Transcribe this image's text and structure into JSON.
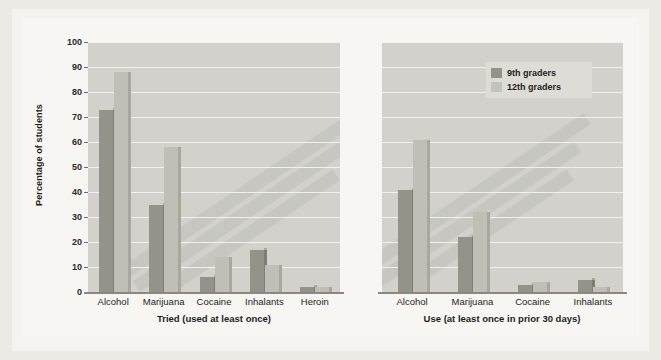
{
  "chart_data": {
    "type": "bar",
    "title": "",
    "ylabel": "Percentage of students",
    "ylim": [
      0,
      100
    ],
    "ytick_values": [
      100,
      90,
      80,
      70,
      60,
      50,
      40,
      30,
      20,
      10,
      0
    ],
    "grid": true,
    "legend_position": "top-right",
    "legend": [
      "9th graders",
      "12th graders"
    ],
    "colors": {
      "series_9th": "#949389",
      "series_12th": "#c0bfb7",
      "panel_background": "#d2d1cc",
      "page_background": "#f4f3ef"
    },
    "panels": [
      {
        "xlabel": "Tried (used at least once)",
        "categories": [
          "Alcohol",
          "Marijuana",
          "Cocaine",
          "Inhalants",
          "Heroin"
        ],
        "series": [
          {
            "name": "9th graders",
            "values": [
              73,
              35,
              6,
              17,
              2
            ]
          },
          {
            "name": "12th graders",
            "values": [
              88,
              58,
              14,
              11,
              2
            ]
          }
        ]
      },
      {
        "xlabel": "Use (at least once in prior 30 days)",
        "categories": [
          "Alcohol",
          "Marijuana",
          "Cocaine",
          "Inhalants"
        ],
        "series": [
          {
            "name": "9th graders",
            "values": [
              41,
              22,
              3,
              5
            ]
          },
          {
            "name": "12th graders",
            "values": [
              61,
              32,
              4,
              2
            ]
          }
        ]
      }
    ]
  }
}
